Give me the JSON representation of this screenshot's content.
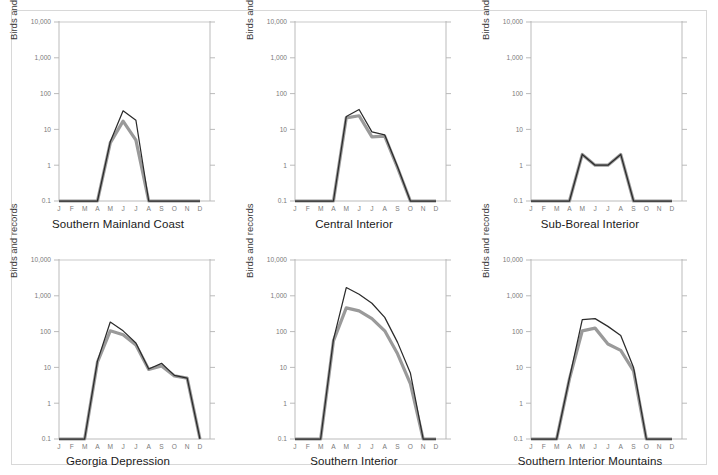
{
  "figure": {
    "background": "#ffffff",
    "border_color": "#d8d8d8",
    "series_colors": {
      "records": "#2b2b2b",
      "birds": "#9a9a9a"
    },
    "axis_color": "#b3b3b3",
    "tick_label_color": "#7a7a7a"
  },
  "axis": {
    "y_label": "Birds and records",
    "y_label_right": "Birds and records",
    "y_ticks": [
      "10,000",
      "1,000",
      "100",
      "10",
      "1",
      "0.1"
    ],
    "y_tick_values": [
      10000,
      1000,
      100,
      10,
      1,
      0.1
    ],
    "y_scale": "log",
    "months": [
      "J",
      "F",
      "M",
      "A",
      "M",
      "J",
      "J",
      "A",
      "S",
      "O",
      "N",
      "D"
    ]
  },
  "chart_data": [
    {
      "type": "line",
      "title": "Southern Mainland Coast",
      "xlabel": "",
      "ylabel": "Birds and records",
      "categories": [
        "J",
        "F",
        "M",
        "A",
        "M",
        "J",
        "J",
        "A",
        "S",
        "O",
        "N",
        "D"
      ],
      "ylim": [
        0.1,
        10000
      ],
      "yscale": "log",
      "grid": false,
      "legend": "none",
      "series": [
        {
          "name": "records",
          "values": [
            0.1,
            0.1,
            0.1,
            0.1,
            4.5,
            33,
            18,
            0.1,
            0.1,
            0.1,
            0.1,
            0.1
          ]
        },
        {
          "name": "birds",
          "values": [
            0.1,
            0.1,
            0.1,
            0.1,
            4.2,
            17,
            5.0,
            0.1,
            0.1,
            0.1,
            0.1,
            0.1
          ]
        }
      ]
    },
    {
      "type": "line",
      "title": "Central Interior",
      "xlabel": "",
      "ylabel": "Birds and records",
      "categories": [
        "J",
        "F",
        "M",
        "A",
        "M",
        "J",
        "J",
        "A",
        "S",
        "O",
        "N",
        "D"
      ],
      "ylim": [
        0.1,
        10000
      ],
      "yscale": "log",
      "grid": false,
      "legend": "none",
      "series": [
        {
          "name": "records",
          "values": [
            0.1,
            0.1,
            0.1,
            0.1,
            23,
            36,
            8.5,
            7.0,
            0.9,
            0.1,
            0.1,
            0.1
          ]
        },
        {
          "name": "birds",
          "values": [
            0.1,
            0.1,
            0.1,
            0.1,
            21,
            24,
            6.2,
            6.5,
            0.85,
            0.1,
            0.1,
            0.1
          ]
        }
      ]
    },
    {
      "type": "line",
      "title": "Sub-Boreal Interior",
      "xlabel": "",
      "ylabel": "Birds and records",
      "categories": [
        "J",
        "F",
        "M",
        "A",
        "M",
        "J",
        "J",
        "A",
        "S",
        "O",
        "N",
        "D"
      ],
      "ylim": [
        0.1,
        10000
      ],
      "yscale": "log",
      "grid": false,
      "legend": "none",
      "series": [
        {
          "name": "records",
          "values": [
            0.1,
            0.1,
            0.1,
            0.1,
            2.0,
            1.0,
            1.0,
            2.0,
            0.1,
            0.1,
            0.1,
            0.1
          ]
        },
        {
          "name": "birds",
          "values": [
            0.1,
            0.1,
            0.1,
            0.1,
            2.0,
            1.0,
            1.0,
            2.0,
            0.1,
            0.1,
            0.1,
            0.1
          ]
        }
      ]
    },
    {
      "type": "line",
      "title": "Georgia Depression",
      "xlabel": "",
      "ylabel": "Birds and records",
      "categories": [
        "J",
        "F",
        "M",
        "A",
        "M",
        "J",
        "J",
        "A",
        "S",
        "O",
        "N",
        "D"
      ],
      "ylim": [
        0.1,
        10000
      ],
      "yscale": "log",
      "grid": false,
      "legend": "none",
      "series": [
        {
          "name": "records",
          "values": [
            0.1,
            0.1,
            0.1,
            15,
            185,
            105,
            48,
            9.0,
            13,
            6.0,
            5.0,
            0.1
          ]
        },
        {
          "name": "birds",
          "values": [
            0.1,
            0.1,
            0.1,
            14,
            105,
            82,
            42,
            8.8,
            11,
            5.8,
            5.0,
            0.1
          ]
        }
      ]
    },
    {
      "type": "line",
      "title": "Southern Interior",
      "xlabel": "",
      "ylabel": "Birds and records",
      "categories": [
        "J",
        "F",
        "M",
        "A",
        "M",
        "J",
        "J",
        "A",
        "S",
        "O",
        "N",
        "D"
      ],
      "ylim": [
        0.1,
        10000
      ],
      "yscale": "log",
      "grid": false,
      "legend": "none",
      "series": [
        {
          "name": "records",
          "values": [
            0.1,
            0.1,
            0.1,
            60,
            1700,
            1100,
            620,
            250,
            50,
            7.0,
            0.1,
            0.1
          ]
        },
        {
          "name": "birds",
          "values": [
            0.1,
            0.1,
            0.1,
            55,
            460,
            380,
            230,
            105,
            24,
            3.5,
            0.1,
            0.1
          ]
        }
      ]
    },
    {
      "type": "line",
      "title": "Southern Interior Mountains",
      "xlabel": "",
      "ylabel": "Birds and records",
      "categories": [
        "J",
        "F",
        "M",
        "A",
        "M",
        "J",
        "J",
        "A",
        "S",
        "O",
        "N",
        "D"
      ],
      "ylim": [
        0.1,
        10000
      ],
      "yscale": "log",
      "grid": false,
      "legend": "none",
      "series": [
        {
          "name": "records",
          "values": [
            0.1,
            0.1,
            0.1,
            5.0,
            215,
            230,
            140,
            78,
            10,
            0.1,
            0.1,
            0.1
          ]
        },
        {
          "name": "birds",
          "values": [
            0.1,
            0.1,
            0.1,
            4.8,
            105,
            125,
            45,
            30,
            8.0,
            0.1,
            0.1,
            0.1
          ]
        }
      ]
    }
  ]
}
